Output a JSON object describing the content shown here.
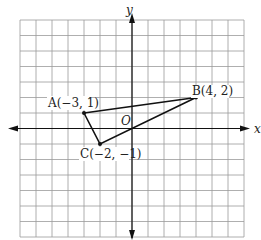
{
  "diagram": {
    "type": "coordinate-plane",
    "grid": {
      "x_min": -7,
      "x_max": 7,
      "y_min": -7,
      "y_max": 7
    },
    "axes": {
      "x_label": "x",
      "y_label": "y",
      "origin_label": "O"
    },
    "points": [
      {
        "name": "A",
        "label": "A(−3, 1)",
        "x": -3,
        "y": 1
      },
      {
        "name": "B",
        "label": "B(4, 2)",
        "x": 4,
        "y": 2
      },
      {
        "name": "C",
        "label": "C(−2, −1)",
        "x": -2,
        "y": -1
      }
    ],
    "segments": [
      [
        "A",
        "B"
      ],
      [
        "B",
        "C"
      ],
      [
        "C",
        "A"
      ]
    ],
    "colors": {
      "grid": "#9a9a9a",
      "axis": "#111111",
      "shape": "#111111"
    }
  }
}
